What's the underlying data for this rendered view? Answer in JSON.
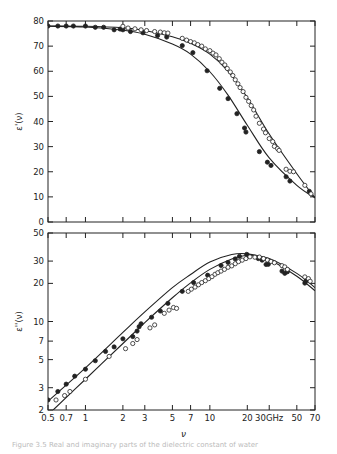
{
  "figure": {
    "caption": "Figure 3.5  Real and imaginary parts of the dielectric constant of water"
  },
  "chart_data": [
    {
      "type": "line",
      "panel": "top",
      "ylabel": "ε'(ν)",
      "xlabel": "",
      "xscale": "log",
      "yscale": "linear",
      "xlim": [
        0.5,
        70
      ],
      "ylim": [
        0,
        80
      ],
      "yticks": [
        0,
        10,
        20,
        30,
        40,
        50,
        60,
        70,
        80
      ],
      "xticks": [
        0.5,
        0.7,
        1,
        2,
        3,
        5,
        7,
        10,
        20,
        30,
        50,
        70
      ],
      "grid": false,
      "series": [
        {
          "name": "filled circles (lower curve)",
          "marker": "filled-circle",
          "points": [
            [
              0.5,
              78
            ],
            [
              0.6,
              78
            ],
            [
              0.7,
              78
            ],
            [
              0.8,
              78
            ],
            [
              1.0,
              78
            ],
            [
              1.2,
              77.5
            ],
            [
              1.4,
              77.5
            ],
            [
              1.7,
              76.5
            ],
            [
              1.9,
              76.8
            ],
            [
              2.0,
              76.5
            ],
            [
              2.3,
              75.8
            ],
            [
              2.9,
              75.3
            ],
            [
              3.8,
              74.2
            ],
            [
              4.5,
              73.6
            ],
            [
              6.0,
              70.2
            ],
            [
              7.3,
              67.4
            ],
            [
              9.5,
              60.2
            ],
            [
              12,
              53.2
            ],
            [
              14,
              49.1
            ],
            [
              16.5,
              43.1
            ],
            [
              19,
              37.4
            ],
            [
              19.5,
              35.8
            ],
            [
              25,
              28
            ],
            [
              29,
              23.8
            ],
            [
              31,
              22.5
            ],
            [
              41,
              18
            ],
            [
              44,
              16.3
            ],
            [
              63,
              12.2
            ]
          ],
          "curve": [
            [
              0.5,
              77.9
            ],
            [
              1,
              77.6
            ],
            [
              2,
              76.3
            ],
            [
              3,
              74.7
            ],
            [
              5,
              70.8
            ],
            [
              7,
              66.8
            ],
            [
              10,
              59.8
            ],
            [
              14,
              50.5
            ],
            [
              20,
              38.5
            ],
            [
              30,
              25.5
            ],
            [
              50,
              14.6
            ],
            [
              70,
              9.6
            ]
          ]
        },
        {
          "name": "open circles (upper curve)",
          "marker": "open-circle",
          "points": [
            [
              2.0,
              77.9
            ],
            [
              2.2,
              77.2
            ],
            [
              2.5,
              76.9
            ],
            [
              2.8,
              76.5
            ],
            [
              3.1,
              76.2
            ],
            [
              3.6,
              75.8
            ],
            [
              4.0,
              75.6
            ],
            [
              4.3,
              75.3
            ],
            [
              4.6,
              75.2
            ],
            [
              6.0,
              73.1
            ],
            [
              6.5,
              72.4
            ],
            [
              7.0,
              71.8
            ],
            [
              7.5,
              71.3
            ],
            [
              8.0,
              70.6
            ],
            [
              8.6,
              70.0
            ],
            [
              9.2,
              68.9
            ],
            [
              10,
              68.2
            ],
            [
              10.6,
              67.2
            ],
            [
              11.2,
              66.5
            ],
            [
              11.9,
              65.0
            ],
            [
              12.5,
              63.6
            ],
            [
              13.2,
              62.5
            ],
            [
              13.8,
              61.1
            ],
            [
              14.6,
              59.7
            ],
            [
              15.3,
              58.3
            ],
            [
              16,
              56.6
            ],
            [
              16.8,
              55.0
            ],
            [
              17.5,
              53.5
            ],
            [
              18.5,
              51.9
            ],
            [
              19.5,
              49.6
            ],
            [
              20.5,
              48.0
            ],
            [
              21.5,
              46.3
            ],
            [
              22.5,
              44.6
            ],
            [
              23.5,
              42.1
            ],
            [
              25,
              39.3
            ],
            [
              27,
              37.0
            ],
            [
              28,
              35.5
            ],
            [
              30,
              33.2
            ],
            [
              32,
              32.0
            ],
            [
              33,
              30.1
            ],
            [
              35,
              29.2
            ],
            [
              36,
              28.5
            ],
            [
              41,
              21.0
            ],
            [
              44,
              20.2
            ],
            [
              47,
              20.0
            ],
            [
              58,
              14.6
            ],
            [
              65,
              11.2
            ]
          ],
          "curve": [
            [
              0.5,
              78
            ],
            [
              1,
              77.9
            ],
            [
              2,
              77.3
            ],
            [
              3,
              76.2
            ],
            [
              5,
              73.7
            ],
            [
              7,
              71.1
            ],
            [
              10,
              66.8
            ],
            [
              14,
              60.0
            ],
            [
              20,
              49.5
            ],
            [
              30,
              35.0
            ],
            [
              50,
              19.2
            ],
            [
              70,
              9.6
            ]
          ]
        }
      ]
    },
    {
      "type": "line",
      "panel": "bottom",
      "ylabel": "ε''(ν)",
      "xlabel": "ν",
      "xscale": "log",
      "yscale": "log",
      "xlim": [
        0.5,
        70
      ],
      "ylim": [
        2,
        50
      ],
      "yticks": [
        2,
        3,
        5,
        7,
        10,
        20,
        30,
        50
      ],
      "xticks": [
        0.5,
        0.7,
        1,
        2,
        3,
        5,
        7,
        10,
        20,
        30,
        50,
        70
      ],
      "xticklabels": [
        "0.5",
        "0.7",
        "1",
        "2",
        "3",
        "5",
        "7",
        "10",
        "20",
        "30GHz",
        "50",
        "70"
      ],
      "grid": false,
      "series": [
        {
          "name": "filled circles (upper curve)",
          "marker": "filled-circle",
          "points": [
            [
              0.5,
              2.4
            ],
            [
              0.6,
              2.8
            ],
            [
              0.7,
              3.2
            ],
            [
              0.82,
              3.7
            ],
            [
              1.0,
              4.2
            ],
            [
              1.2,
              4.9
            ],
            [
              1.45,
              5.8
            ],
            [
              1.7,
              6.3
            ],
            [
              2.0,
              7.3
            ],
            [
              2.4,
              7.6
            ],
            [
              2.6,
              8.4
            ],
            [
              2.7,
              9.1
            ],
            [
              2.8,
              9.6
            ],
            [
              3.4,
              10.8
            ],
            [
              4.0,
              12.1
            ],
            [
              4.6,
              13.9
            ],
            [
              6.0,
              17.3
            ],
            [
              7.4,
              20.3
            ],
            [
              9.6,
              23.2
            ],
            [
              12.3,
              27.7
            ],
            [
              14.0,
              29.3
            ],
            [
              16.0,
              31.2
            ],
            [
              17.3,
              32.7
            ],
            [
              19.8,
              33.9
            ],
            [
              20.3,
              33.0
            ],
            [
              24.5,
              31.4
            ],
            [
              26.3,
              30.5
            ],
            [
              28.3,
              28.2
            ],
            [
              29.5,
              28.3
            ],
            [
              38,
              25.0
            ],
            [
              40,
              24.0
            ],
            [
              42,
              24.7
            ],
            [
              58,
              20.1
            ],
            [
              59,
              20.8
            ]
          ],
          "curve": [
            [
              0.5,
              2.35
            ],
            [
              1,
              4.3
            ],
            [
              2,
              8.2
            ],
            [
              3,
              11.9
            ],
            [
              5,
              18.5
            ],
            [
              7,
              23.5
            ],
            [
              10,
              29.5
            ],
            [
              15,
              33.8
            ],
            [
              20,
              34.2
            ],
            [
              30,
              30.8
            ],
            [
              50,
              22.8
            ],
            [
              70,
              17.5
            ]
          ]
        },
        {
          "name": "open circles (lower curve)",
          "marker": "open-circle",
          "points": [
            [
              0.58,
              2.4
            ],
            [
              0.68,
              2.6
            ],
            [
              0.75,
              2.8
            ],
            [
              1.0,
              3.5
            ],
            [
              1.55,
              5.3
            ],
            [
              2.1,
              6.1
            ],
            [
              2.4,
              6.7
            ],
            [
              2.6,
              7.2
            ],
            [
              3.3,
              8.9
            ],
            [
              3.6,
              9.4
            ],
            [
              4.3,
              11.6
            ],
            [
              4.7,
              12.3
            ],
            [
              5.1,
              12.9
            ],
            [
              5.4,
              12.7
            ],
            [
              6.7,
              17.3
            ],
            [
              7.1,
              18.0
            ],
            [
              7.6,
              18.7
            ],
            [
              8.1,
              19.5
            ],
            [
              8.6,
              20.3
            ],
            [
              9.2,
              21.0
            ],
            [
              9.8,
              21.8
            ],
            [
              10.4,
              22.6
            ],
            [
              11.0,
              23.6
            ],
            [
              11.6,
              24.3
            ],
            [
              12.3,
              25.0
            ],
            [
              13.1,
              25.8
            ],
            [
              14,
              26.8
            ],
            [
              15,
              27.5
            ],
            [
              16,
              28.6
            ],
            [
              17,
              29.7
            ],
            [
              18.2,
              30.5
            ],
            [
              19.5,
              31.4
            ],
            [
              21,
              32.4
            ],
            [
              23,
              32.2
            ],
            [
              25,
              32.3
            ],
            [
              27,
              31.4
            ],
            [
              29,
              30.6
            ],
            [
              31,
              29.8
            ],
            [
              33,
              29.1
            ],
            [
              38,
              27.6
            ],
            [
              40,
              27.0
            ],
            [
              42,
              25.8
            ],
            [
              58,
              22.5
            ],
            [
              62,
              21.8
            ],
            [
              64,
              20.8
            ]
          ],
          "curve": [
            [
              0.55,
              2.0
            ],
            [
              1,
              3.5
            ],
            [
              2,
              6.7
            ],
            [
              3,
              9.8
            ],
            [
              5,
              15.4
            ],
            [
              7,
              20.2
            ],
            [
              10,
              25.8
            ],
            [
              15,
              31.2
            ],
            [
              20,
              33.2
            ],
            [
              30,
              31.5
            ],
            [
              50,
              24.0
            ],
            [
              70,
              18.5
            ]
          ]
        }
      ]
    }
  ]
}
